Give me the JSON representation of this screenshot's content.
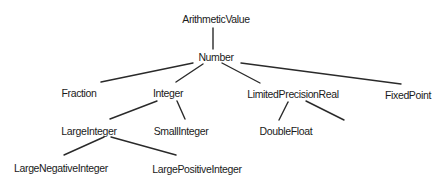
{
  "diagram": {
    "colors": {
      "background": "#ffffff",
      "text": "#1a1a1a",
      "edge": "#2a2a2a"
    },
    "nodes": [
      {
        "id": "arithmetic-value",
        "label": "ArithmeticValue",
        "x": 216,
        "y": 19
      },
      {
        "id": "number",
        "label": "Number",
        "x": 216,
        "y": 57
      },
      {
        "id": "fraction",
        "label": "Fraction",
        "x": 79,
        "y": 93
      },
      {
        "id": "integer",
        "label": "Integer",
        "x": 168,
        "y": 93
      },
      {
        "id": "limited-precision-real",
        "label": "LimitedPrecisionReal",
        "x": 293,
        "y": 94
      },
      {
        "id": "fixed-point",
        "label": "FixedPoint",
        "x": 408,
        "y": 95
      },
      {
        "id": "large-integer",
        "label": "LargeInteger",
        "x": 89,
        "y": 131
      },
      {
        "id": "small-integer",
        "label": "SmallInteger",
        "x": 181,
        "y": 131
      },
      {
        "id": "double-float",
        "label": "DoubleFloat",
        "x": 286,
        "y": 131
      },
      {
        "id": "large-negative-integer",
        "label": "LargeNegativeInteger",
        "x": 61,
        "y": 168
      },
      {
        "id": "large-positive-integer",
        "label": "LargePositiveInteger",
        "x": 197,
        "y": 169
      }
    ],
    "edges": [
      {
        "from": "arithmetic-value",
        "to": "number",
        "x1": 213,
        "y1": 28,
        "x2": 213,
        "y2": 49
      },
      {
        "from": "number",
        "to": "fraction",
        "x1": 193,
        "y1": 63,
        "x2": 101,
        "y2": 82
      },
      {
        "from": "number",
        "to": "integer",
        "x1": 203,
        "y1": 64,
        "x2": 176,
        "y2": 82
      },
      {
        "from": "number",
        "to": "limited-precision-real",
        "x1": 222,
        "y1": 63,
        "x2": 260,
        "y2": 83
      },
      {
        "from": "number",
        "to": "fixed-point",
        "x1": 241,
        "y1": 63,
        "x2": 401,
        "y2": 84
      },
      {
        "from": "integer",
        "to": "large-integer",
        "x1": 157,
        "y1": 101,
        "x2": 110,
        "y2": 119
      },
      {
        "from": "integer",
        "to": "small-integer",
        "x1": 177,
        "y1": 101,
        "x2": 185,
        "y2": 119
      },
      {
        "from": "limited-precision-real",
        "to": "double-float",
        "x1": 288,
        "y1": 102,
        "x2": 279,
        "y2": 120
      },
      {
        "from": "limited-precision-real",
        "to": "unlabeled",
        "x1": 306,
        "y1": 101,
        "x2": 344,
        "y2": 120
      },
      {
        "from": "large-integer",
        "to": "large-negative-integer",
        "x1": 104,
        "y1": 137,
        "x2": 64,
        "y2": 155
      },
      {
        "from": "large-integer",
        "to": "large-positive-integer",
        "x1": 111,
        "y1": 137,
        "x2": 176,
        "y2": 155
      }
    ]
  }
}
